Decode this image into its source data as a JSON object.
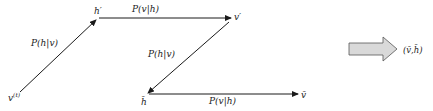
{
  "diagram": {
    "nodes": {
      "v_t": {
        "label": "v",
        "superscript": "(t)"
      },
      "h_prime": {
        "label": "h′"
      },
      "v_prime": {
        "label": "v′"
      },
      "h_bar": {
        "label": "h̄"
      },
      "v_bar": {
        "label": "v̄"
      }
    },
    "edges": {
      "vt_to_hprime": {
        "label": "P(h|v)"
      },
      "hprime_to_vprime": {
        "label": "P(v|h)"
      },
      "vprime_to_hbar": {
        "label": "P(h|v)"
      },
      "hbar_to_vbar": {
        "label": "P(v|h)"
      }
    },
    "result": {
      "label": "(v̄,h̄)"
    },
    "colors": {
      "line": "#1a1a1a",
      "fat_arrow_fill": "#d9d9d9",
      "fat_arrow_stroke": "#555555"
    }
  }
}
